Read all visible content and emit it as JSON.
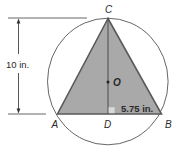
{
  "figure": {
    "type": "geometry-diagram",
    "colors": {
      "triangle_fill": "#a9a9a9",
      "triangle_stroke": "#5a5a5a",
      "circle_stroke": "#555555",
      "dimension_line": "#444444",
      "background": "#ffffff"
    },
    "points": {
      "A": {
        "label": "A"
      },
      "B": {
        "label": "B"
      },
      "C": {
        "label": "C"
      },
      "D": {
        "label": "D"
      },
      "O": {
        "label": "O"
      }
    },
    "dimensions": {
      "height": {
        "label": "10 in."
      },
      "half_base": {
        "label": "5.75 in."
      }
    },
    "right_angle_marker": {
      "at": "D"
    }
  }
}
